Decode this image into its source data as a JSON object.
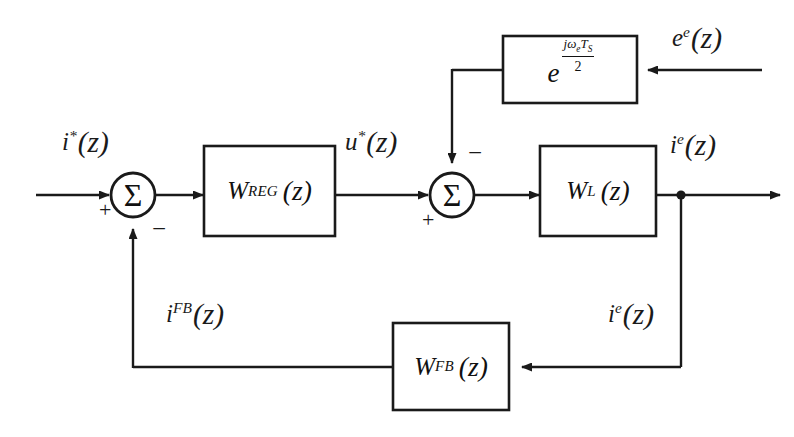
{
  "diagram": {
    "background_color": "#ffffff",
    "line_color": "#1a1a1a",
    "blocks": [
      {
        "id": "delay",
        "kind": "transfer-block",
        "label_plain": "e^(jω_e T_S / 2)",
        "base": "e",
        "numerator_j": "j",
        "numerator_omega": "ω",
        "numerator_omega_sub": "e",
        "numerator_T": "T",
        "numerator_T_sub": "S",
        "denominator": "2"
      },
      {
        "id": "regulator",
        "kind": "transfer-block",
        "main": "W",
        "sub": "REG",
        "arg": "(z)",
        "label_plain": "W_REG (z)"
      },
      {
        "id": "load",
        "kind": "transfer-block",
        "main": "W",
        "sub": "L",
        "arg": "(z)",
        "label_plain": "W_L (z)"
      },
      {
        "id": "feedback",
        "kind": "transfer-block",
        "main": "W",
        "sub": "FB",
        "arg": "(z)",
        "label_plain": "W_FB (z)"
      }
    ],
    "summers": [
      {
        "id": "summer-1",
        "glyph": "Σ",
        "signs": [
          {
            "port": "left",
            "sign": "+"
          },
          {
            "port": "bottom",
            "sign": "−"
          }
        ]
      },
      {
        "id": "summer-2",
        "glyph": "Σ",
        "signs": [
          {
            "port": "left",
            "sign": "+"
          },
          {
            "port": "top",
            "sign": "−"
          }
        ]
      }
    ],
    "signals": [
      {
        "id": "reference-current",
        "var": "i",
        "sup": "*",
        "arg": "(z)",
        "label_plain": "i*(z)",
        "position": "input-left"
      },
      {
        "id": "control-voltage",
        "var": "u",
        "sup": "*",
        "arg": "(z)",
        "label_plain": "u*(z)",
        "position": "regulator-output"
      },
      {
        "id": "back-emf",
        "var": "e",
        "sup": "e",
        "arg": "(z)",
        "label_plain": "e^e(z)",
        "position": "input-top-right"
      },
      {
        "id": "output-current",
        "var": "i",
        "sup": "e",
        "arg": "(z)",
        "label_plain": "i^e(z)",
        "position": "load-output"
      },
      {
        "id": "measured-current",
        "var": "i",
        "sup": "e",
        "arg": "(z)",
        "label_plain": "i^e(z)",
        "position": "feedback-tap"
      },
      {
        "id": "feedback-current",
        "var": "i",
        "sup": "FB",
        "arg": "(z)",
        "label_plain": "i^FB(z)",
        "position": "feedback-return"
      }
    ],
    "symbols": {
      "plus": "+",
      "minus": "−",
      "sigma": "Σ",
      "paren_open": "(",
      "paren_close": ")",
      "z": "z"
    }
  }
}
